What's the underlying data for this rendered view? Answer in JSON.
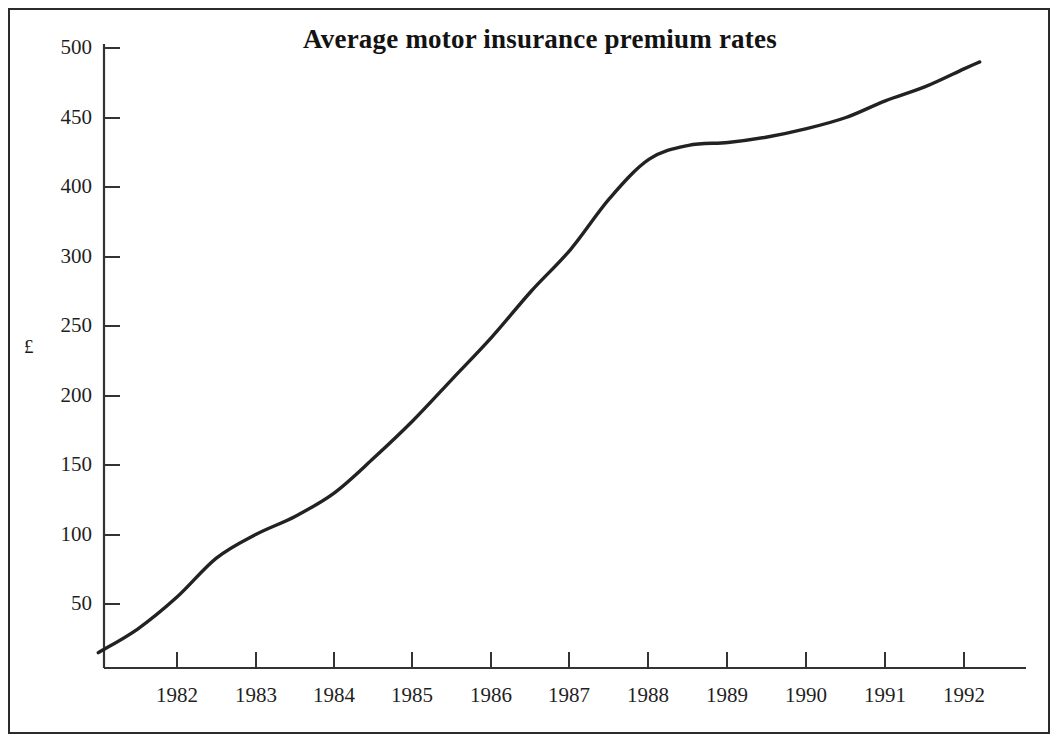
{
  "figure": {
    "title": "Average motor insurance premium rates",
    "y_axis_label": "£",
    "frame": true
  },
  "chart_data": {
    "type": "line",
    "title": "Average motor insurance premium rates",
    "xlabel": "",
    "ylabel": "£",
    "grid": false,
    "legend": "none",
    "xlim": [
      1981.0,
      1992.5
    ],
    "ylim": [
      0,
      500
    ],
    "x_tick_labels": [
      "1982",
      "1983",
      "1984",
      "1985",
      "1986",
      "1987",
      "1988",
      "1989",
      "1990",
      "1991",
      "1992"
    ],
    "y_tick_labels": [
      "500",
      "450",
      "400",
      "300",
      "250",
      "200",
      "150",
      "100",
      "50"
    ],
    "y_tick_values": [
      500,
      450,
      400,
      350,
      300,
      250,
      200,
      150,
      100
    ],
    "note_on_y_axis": "Ticks are evenly spaced in 50-unit steps; the fourth tick from the top is printed as 300 in the original (350 label omitted).",
    "series": [
      {
        "name": "Average motor insurance premium",
        "units": "£",
        "x": [
          1981.0,
          1981.5,
          1982.0,
          1982.5,
          1983.0,
          1983.5,
          1984.0,
          1984.5,
          1985.0,
          1985.5,
          1986.0,
          1986.5,
          1987.0,
          1987.5,
          1988.0,
          1988.5,
          1989.0,
          1989.5,
          1990.0,
          1990.5,
          1991.0,
          1991.5,
          1992.0,
          1992.2
        ],
        "values": [
          65,
          82,
          105,
          133,
          150,
          163,
          180,
          205,
          232,
          262,
          292,
          325,
          355,
          392,
          420,
          430,
          432,
          436,
          442,
          450,
          462,
          472,
          485,
          490
        ]
      }
    ],
    "start_value": 65,
    "end_value": 490
  },
  "axes": {
    "y_ticks": [
      {
        "label": "500",
        "y": 48
      },
      {
        "label": "450",
        "y": 118
      },
      {
        "label": "400",
        "y": 187
      },
      {
        "label": "300",
        "y": 257
      },
      {
        "label": "250",
        "y": 326
      },
      {
        "label": "200",
        "y": 396
      },
      {
        "label": "150",
        "y": 465
      },
      {
        "label": "100",
        "y": 535
      },
      {
        "label": "50",
        "y": 604
      }
    ],
    "x_ticks": [
      {
        "label": "1982",
        "x": 177
      },
      {
        "label": "1983",
        "x": 256
      },
      {
        "label": "1984",
        "x": 334
      },
      {
        "label": "1985",
        "x": 412
      },
      {
        "label": "1986",
        "x": 491
      },
      {
        "label": "1987",
        "x": 569
      },
      {
        "label": "1988",
        "x": 648
      },
      {
        "label": "1989",
        "x": 727
      },
      {
        "label": "1990",
        "x": 806
      },
      {
        "label": "1991",
        "x": 885
      },
      {
        "label": "1992",
        "x": 964
      }
    ]
  },
  "style": {
    "line_color": "#222222",
    "axis_color": "#333333",
    "frame_color": "#2b2b2b",
    "background": "#ffffff"
  }
}
